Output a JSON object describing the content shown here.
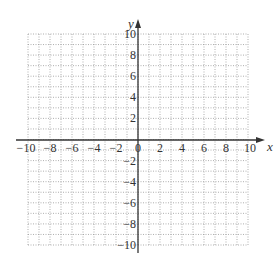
{
  "chart_data": {
    "type": "scatter",
    "title": "",
    "xlabel": "x",
    "ylabel": "y",
    "xlim": [
      -10,
      10
    ],
    "ylim": [
      -10,
      10
    ],
    "grid": true,
    "grid_style": "dotted",
    "grid_step": 1,
    "x_ticks": [
      -10,
      -8,
      -6,
      -4,
      -2,
      0,
      2,
      4,
      6,
      8,
      10
    ],
    "x_tick_labels": [
      "−10",
      "−8",
      "−6",
      "−4",
      "−2",
      "0",
      "2",
      "4",
      "6",
      "8",
      "10"
    ],
    "y_ticks": [
      -10,
      -8,
      -6,
      -4,
      -2,
      2,
      4,
      6,
      8,
      10
    ],
    "y_tick_labels": [
      "−10",
      "−8",
      "−6",
      "−4",
      "−2",
      "2",
      "4",
      "6",
      "8",
      "10"
    ],
    "series": [],
    "legend": null
  },
  "axes": {
    "x_label": "x",
    "y_label": "y"
  },
  "colors": {
    "axis": "#333333",
    "grid": "#9a9a9a",
    "background": "#ffffff"
  }
}
